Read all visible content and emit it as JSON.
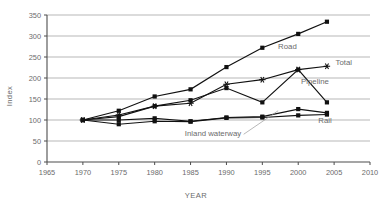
{
  "chart_data": {
    "type": "line",
    "title": "",
    "xlabel": "YEAR",
    "ylabel": "Index",
    "xlim": [
      1965,
      2010
    ],
    "ylim": [
      0,
      350
    ],
    "xticks": [
      1965,
      1970,
      1975,
      1980,
      1985,
      1990,
      1995,
      2000,
      2005,
      2010
    ],
    "yticks": [
      0,
      50,
      100,
      150,
      200,
      250,
      300,
      350
    ],
    "grid": "horizontal",
    "legend_position": "inline-right-labels",
    "x": [
      1970,
      1975,
      1980,
      1985,
      1990,
      1995,
      2000,
      2004
    ],
    "series": [
      {
        "name": "Road",
        "marker": "square",
        "values": [
          100,
          122,
          156,
          173,
          226,
          272,
          305,
          334
        ],
        "label": "Road",
        "label_x": 1997.2,
        "label_y": 268
      },
      {
        "name": "Total",
        "marker": "star",
        "values": [
          100,
          112,
          133,
          140,
          185,
          196,
          220,
          228
        ],
        "label": "Total",
        "label_x": 2005.2,
        "label_y": 231
      },
      {
        "name": "Pipeline",
        "marker": "square",
        "values": [
          100,
          108,
          133,
          147,
          176,
          142,
          220,
          142
        ],
        "label": "Pipeline",
        "label_x": 2000.4,
        "label_y": 186
      },
      {
        "name": "Inland waterway",
        "marker": "square",
        "values": [
          100,
          100,
          104,
          97,
          106,
          108,
          126,
          117
        ],
        "label": "Inland waterway",
        "label_x": 1984.2,
        "label_y": 62
      },
      {
        "name": "Rail",
        "marker": "square",
        "values": [
          100,
          90,
          97,
          96,
          105,
          106,
          111,
          113
        ],
        "label": "Rail",
        "label_x": 2002.8,
        "label_y": 93
      }
    ],
    "annotations": [
      {
        "text": "Inland waterway",
        "leader_from_x": 1992.4,
        "leader_from_y": 66,
        "leader_to_x": 1997.2,
        "leader_to_y": 122
      }
    ]
  },
  "axis": {
    "y_title": "Index",
    "x_title": "YEAR",
    "y_tick_labels": [
      "0",
      "50",
      "100",
      "150",
      "200",
      "250",
      "300",
      "350"
    ],
    "x_tick_labels": [
      "1965",
      "1970",
      "1975",
      "1980",
      "1985",
      "1990",
      "1995",
      "2000",
      "2005",
      "2010"
    ]
  },
  "colors": {
    "series_stroke": "#111111",
    "grid": "#9a9a9a",
    "axis": "#4d4d4d",
    "text": "#6b6b6b",
    "background": "#ffffff"
  }
}
